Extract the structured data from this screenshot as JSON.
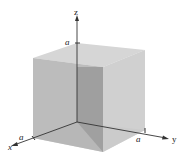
{
  "diagram": {
    "title": "",
    "type": "3d-cube-in-first-octant",
    "axes": {
      "x": {
        "label": "x",
        "tick_label": "a"
      },
      "y": {
        "label": "y",
        "tick_label": "a"
      },
      "z": {
        "label": "z",
        "tick_label": "a"
      }
    },
    "colors": {
      "top_face": "#d6d6d6",
      "left_face": "#b3b3b3",
      "right_face": "#c9c9c9",
      "inner_shadow": "#8f8f8f",
      "axis": "#333333"
    }
  }
}
